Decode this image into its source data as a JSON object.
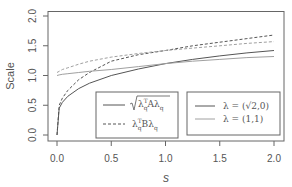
{
  "chart_data": {
    "type": "line",
    "title": "",
    "xlabel": "s",
    "ylabel": "Scale",
    "xlim": [
      0,
      2
    ],
    "ylim": [
      0,
      2
    ],
    "x_ticks": [
      "0.0",
      "0.5",
      "1.0",
      "1.5",
      "2.0"
    ],
    "y_ticks": [
      "0.0",
      "0.5",
      "1.0",
      "1.5",
      "2.0"
    ],
    "grid": false,
    "x": [
      0.0,
      0.02,
      0.05,
      0.1,
      0.2,
      0.3,
      0.5,
      0.75,
      1.0,
      1.25,
      1.5,
      1.75,
      2.0
    ],
    "series": [
      {
        "name": "sqrt(λqᵀAλq), λ=(√2,0)",
        "style": "solid",
        "color": "#555555",
        "values": [
          0.0,
          0.45,
          0.55,
          0.65,
          0.78,
          0.87,
          1.0,
          1.11,
          1.2,
          1.27,
          1.33,
          1.38,
          1.42
        ]
      },
      {
        "name": "λqᵀBλq, λ=(√2,0)",
        "style": "dashed",
        "color": "#555555",
        "values": [
          0.0,
          0.5,
          0.62,
          0.75,
          0.93,
          1.05,
          1.24,
          1.35,
          1.42,
          1.5,
          1.56,
          1.62,
          1.68
        ]
      },
      {
        "name": "sqrt(λqᵀAλq), λ=(1,1)",
        "style": "solid",
        "color": "#999999",
        "values": [
          1.0,
          1.01,
          1.02,
          1.03,
          1.05,
          1.07,
          1.1,
          1.15,
          1.2,
          1.24,
          1.27,
          1.3,
          1.32
        ]
      },
      {
        "name": "λqᵀBλq, λ=(1,1)",
        "style": "dashed",
        "color": "#999999",
        "values": [
          1.05,
          1.07,
          1.1,
          1.13,
          1.19,
          1.24,
          1.31,
          1.37,
          1.42,
          1.46,
          1.5,
          1.54,
          1.57
        ]
      }
    ],
    "legends": [
      {
        "position": "bottom-center",
        "entries": [
          {
            "label": "√(λqᵀAλq)",
            "style": "solid",
            "color": "#555555"
          },
          {
            "label": "λqᵀBλq",
            "style": "dashed",
            "color": "#555555"
          }
        ]
      },
      {
        "position": "bottom-right",
        "entries": [
          {
            "label": "λ = (√2,0)",
            "style": "solid",
            "color": "#555555"
          },
          {
            "label": "λ = (1,1)",
            "style": "solid",
            "color": "#999999"
          }
        ]
      }
    ]
  },
  "labels": {
    "xlabel": "s",
    "ylabel": "Scale",
    "legend1": {
      "a_pre": "λ",
      "a_sup": "T",
      "a_sub": "q",
      "a_mid": "Aλ",
      "a_sub2": "q",
      "b_pre": "λ",
      "b_sup": "T",
      "b_sub": "q",
      "b_mid": "Bλ",
      "b_sub2": "q"
    },
    "legend2": {
      "l1": "λ = (√2,0)",
      "l2": "λ = (1,1)"
    }
  },
  "colors": {
    "dark": "#555555",
    "light": "#a0a0a0",
    "axis": "#666666",
    "text": "#555555"
  }
}
